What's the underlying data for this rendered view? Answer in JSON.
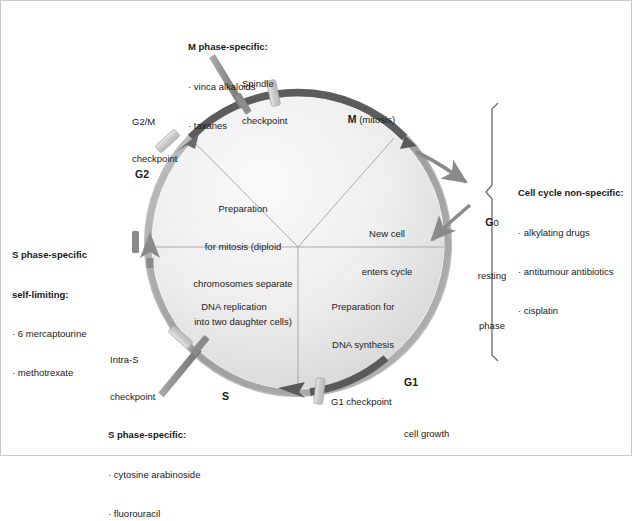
{
  "figure": {
    "circle": {
      "cx": 298,
      "cy": 243,
      "r": 151
    }
  },
  "drug_boxes": {
    "m_phase": {
      "header": "M phase-specific:",
      "items": [
        "vinca alkaloids",
        "taxanes"
      ]
    },
    "s_phase_self_limiting": {
      "header_line1": "S phase-specific",
      "header_line2": "self-limiting:",
      "items": [
        "6 mercaptourine",
        "methotrexate"
      ]
    },
    "s_phase": {
      "header": "S phase-specific:",
      "items": [
        "cytosine arabinoside",
        "fluorouracil"
      ]
    },
    "non_specific": {
      "header": "Cell cycle non-specific:",
      "items": [
        "alkylating drugs",
        "antitumour antibiotics",
        "cisplatin"
      ]
    }
  },
  "checkpoints": [
    {
      "id": "spindle",
      "line1": "Spindle",
      "line2": "checkpoint"
    },
    {
      "id": "g2m",
      "line1": "G2/M",
      "line2": "checkpoint"
    },
    {
      "id": "intra-s",
      "line1": "Intra-S",
      "line2": "checkpoint"
    },
    {
      "id": "g1",
      "line1": "G1 checkpoint",
      "line2": ""
    }
  ],
  "phases": {
    "m": {
      "letter": "M",
      "sub": " (mitosis)"
    },
    "g2": {
      "letter": "G2",
      "sub": ""
    },
    "s": {
      "letter": "S",
      "sub": ""
    },
    "g1": {
      "letter": "G1",
      "sub": "cell growth"
    },
    "g0": {
      "letter": "G",
      "digit": "0",
      "sub_line1": "resting",
      "sub_line2": "phase"
    }
  },
  "quadrant_text": {
    "g2": [
      "Preparation",
      "for mitosis (diploid",
      "chromosomes separate",
      "into two daughter cells)"
    ],
    "m": [
      "New cell",
      "enters cycle"
    ],
    "s": [
      "DNA replication"
    ],
    "g1": [
      "Preparation for",
      "DNA synthesis"
    ]
  },
  "colors": {
    "m_arc": "#5c5c5c",
    "ring": "#9a9a9a",
    "disc_light": "#f2f2f2",
    "disc_dark": "#d8d8d8",
    "arrow_gray": "#8a8a8a",
    "checkpoint_bar": "#d0d0d0",
    "text": "#1a1a1a",
    "frame": "#c9c9c9"
  }
}
